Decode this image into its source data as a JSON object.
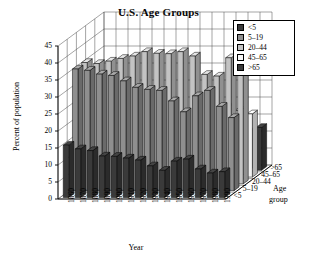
{
  "chart_data": {
    "type": "bar",
    "title": "U.S. Age Groups",
    "xlabel": "Year",
    "ylabel": "Percent of population",
    "zlabel_line1": "Age",
    "zlabel_line2": "group",
    "ylim": [
      0,
      45
    ],
    "yticks": [
      0,
      5,
      10,
      15,
      20,
      25,
      30,
      35,
      40,
      45
    ],
    "grid": true,
    "legend_position": "top-right",
    "projection": "3d-rows",
    "categories": [
      "1860",
      "1870",
      "1880",
      "1890",
      "1900",
      "1910",
      "1920",
      "1930",
      "1940",
      "1950",
      "1960",
      "1970",
      "1980",
      "1990"
    ],
    "depth_categories": [
      "<5",
      "5–19",
      "20–44",
      "45–65",
      ">65"
    ],
    "depth_tick_labels_top_to_bottom": [
      ">65",
      "45–65",
      "20–44",
      "5–19",
      "<5"
    ],
    "series": [
      {
        "name": "<5",
        "color": "#3a3a3a",
        "values": [
          15.4,
          14.3,
          13.8,
          12.2,
          12.1,
          11.6,
          11.0,
          9.3,
          8.0,
          10.7,
          11.3,
          8.4,
          7.2,
          7.6
        ]
      },
      {
        "name": "5–19",
        "color": "#8f8f8f",
        "values": [
          35.8,
          35.4,
          34.3,
          33.9,
          32.3,
          30.4,
          29.8,
          29.5,
          26.4,
          23.2,
          27.9,
          29.5,
          24.8,
          21.5
        ]
      },
      {
        "name": "20–44",
        "color": "#c3c3c3",
        "values": [
          35.7,
          35.4,
          36.1,
          36.9,
          37.6,
          38.9,
          38.4,
          38.3,
          38.9,
          37.6,
          32.2,
          31.7,
          37.1,
          39.6
        ]
      },
      {
        "name": "45–65",
        "color": "#f2f2f2",
        "values": [
          10.5,
          11.0,
          11.6,
          12.4,
          13.7,
          14.6,
          15.8,
          17.4,
          19.8,
          20.3,
          20.1,
          20.6,
          19.6,
          18.6
        ]
      },
      {
        "name": ">65",
        "color": "#3a3a3a",
        "values": [
          2.7,
          3.0,
          3.4,
          3.9,
          4.1,
          4.3,
          4.7,
          5.4,
          6.8,
          8.1,
          9.2,
          9.8,
          11.3,
          12.6
        ]
      }
    ]
  },
  "legend": {
    "items": [
      {
        "label": "<5",
        "color": "#3a3a3a"
      },
      {
        "label": "5–19",
        "color": "#8f8f8f"
      },
      {
        "label": "20–44",
        "color": "#c3c3c3"
      },
      {
        "label": "45–65",
        "color": "#f6f6f6"
      },
      {
        "label": ">65",
        "color": "#3a3a3a"
      }
    ]
  }
}
